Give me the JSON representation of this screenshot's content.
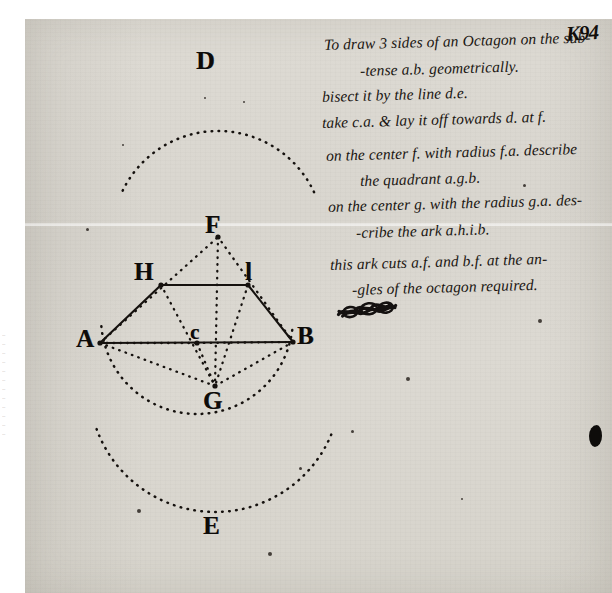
{
  "document": {
    "kind": "handwritten-manuscript-page",
    "folio_number": "K94",
    "ink_color": "#17130f",
    "paper_color": "#dbd8d1"
  },
  "notes": {
    "lines": [
      {
        "text": "To draw 3 sides of an Octagon on the sub-",
        "x": 324,
        "y": 36,
        "indent": 0
      },
      {
        "text": "-tense a.b.  geometrically.",
        "x": 360,
        "y": 62,
        "indent": 1
      },
      {
        "text": "bisect it by the line d.e.",
        "x": 322,
        "y": 88,
        "indent": 0
      },
      {
        "text": "take c.a. & lay it off towards d. at f.",
        "x": 322,
        "y": 114,
        "indent": 0
      },
      {
        "text": "on the center f. with radius f.a. describe",
        "x": 326,
        "y": 147,
        "indent": 0
      },
      {
        "text": "the quadrant a.g.b.",
        "x": 360,
        "y": 172,
        "indent": 1
      },
      {
        "text": "on the center g. with the radius g.a. des-",
        "x": 328,
        "y": 198,
        "indent": 0
      },
      {
        "text": "-cribe the ark a.h.i.b.",
        "x": 356,
        "y": 224,
        "indent": 1
      },
      {
        "text": "this ark cuts a.f. and b.f. at the an-",
        "x": 330,
        "y": 256,
        "indent": 0
      },
      {
        "text": "-gles of the octagon required.",
        "x": 352,
        "y": 281,
        "indent": 1
      }
    ]
  },
  "diagram": {
    "points": [
      {
        "id": "A",
        "label": "A",
        "x": 100,
        "y": 343,
        "label_x": 76,
        "label_y": 325,
        "style": "plate-label"
      },
      {
        "id": "B",
        "label": "B",
        "x": 293,
        "y": 342,
        "label_x": 297,
        "label_y": 322,
        "style": "plate-label"
      },
      {
        "id": "C",
        "label": "c",
        "x": 197,
        "y": 343,
        "label_x": 190,
        "label_y": 320,
        "style": "plate-label sm"
      },
      {
        "id": "D",
        "label": "D",
        "x": 213,
        "y": 72,
        "label_x": 196,
        "label_y": 46,
        "style": "plate-label serifD"
      },
      {
        "id": "E",
        "label": "E",
        "x": 215,
        "y": 530,
        "label_x": 203,
        "label_y": 512,
        "style": "plate-label"
      },
      {
        "id": "F",
        "label": "F",
        "x": 218,
        "y": 237,
        "label_x": 205,
        "label_y": 211,
        "style": "plate-label"
      },
      {
        "id": "G",
        "label": "G",
        "x": 215,
        "y": 386,
        "label_x": 203,
        "label_y": 387,
        "style": "plate-label"
      },
      {
        "id": "H",
        "label": "H",
        "x": 161,
        "y": 285,
        "label_x": 134,
        "label_y": 258,
        "style": "plate-label"
      },
      {
        "id": "I",
        "label": "l",
        "x": 248,
        "y": 285,
        "label_x": 245,
        "label_y": 258,
        "style": "plate-label"
      }
    ],
    "solid_edges": [
      {
        "from": "A",
        "to": "B",
        "name": "subtense-a-b"
      },
      {
        "from": "A",
        "to": "H",
        "name": "octagon-side-a-h"
      },
      {
        "from": "H",
        "to": "I",
        "name": "octagon-side-h-i"
      },
      {
        "from": "I",
        "to": "B",
        "name": "octagon-side-i-b"
      }
    ],
    "dotted_edges": [
      {
        "from": "A",
        "to": "F",
        "name": "construction-a-f"
      },
      {
        "from": "B",
        "to": "F",
        "name": "construction-b-f"
      },
      {
        "from": "A",
        "to": "G",
        "name": "construction-a-g"
      },
      {
        "from": "B",
        "to": "G",
        "name": "construction-b-g"
      },
      {
        "from": "C",
        "to": "G",
        "name": "construction-c-g"
      },
      {
        "from": "F",
        "to": "G",
        "name": "axis-d-e-segment"
      },
      {
        "from": "H",
        "to": "G",
        "name": "radius-g-h"
      },
      {
        "from": "I",
        "to": "G",
        "name": "radius-g-i"
      },
      {
        "from": "A",
        "to": "C",
        "name": "half-subtense-a-c"
      },
      {
        "from": "C",
        "to": "B",
        "name": "half-subtense-c-b"
      }
    ],
    "dotted_arcs": [
      {
        "name": "quadrant-a-g-b",
        "cx": 218,
        "cy": 237,
        "r": 106,
        "start_deg": 25,
        "end_deg": 155
      },
      {
        "name": "ark-a-h-i-b",
        "cx": 215,
        "cy": 386,
        "r": 126,
        "start_deg": 200,
        "end_deg": 340
      },
      {
        "name": "circle-upper-arc",
        "cx": 197,
        "cy": 318,
        "r": 96,
        "start_deg": 185,
        "end_deg": 355
      }
    ]
  },
  "marks": {
    "strikeout_scribble": {
      "name": "crossed-out-word",
      "x": 336,
      "y": 302
    },
    "edge_blob": {
      "name": "page-edge-ink-blot",
      "x": 589,
      "y": 425
    },
    "specks": [
      {
        "x": 122,
        "y": 144
      },
      {
        "x": 86,
        "y": 228
      },
      {
        "x": 137,
        "y": 509
      },
      {
        "x": 243,
        "y": 101
      },
      {
        "x": 299,
        "y": 467
      },
      {
        "x": 406,
        "y": 377
      },
      {
        "x": 461,
        "y": 498
      },
      {
        "x": 523,
        "y": 184
      },
      {
        "x": 538,
        "y": 319
      },
      {
        "x": 204,
        "y": 97
      },
      {
        "x": 351,
        "y": 430
      },
      {
        "x": 268,
        "y": 552
      }
    ]
  },
  "margin_bleed": {
    "name": "verso-bleed-through",
    "lines": [
      "...",
      "...",
      "...",
      "...",
      "...",
      "...",
      "...",
      "...",
      "...",
      "...",
      "...",
      "..."
    ]
  }
}
